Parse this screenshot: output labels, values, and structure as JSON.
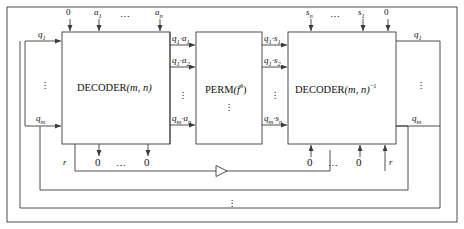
{
  "diagram": {
    "stroke_color": "#3b3b3b",
    "background": "#ffffff",
    "boxes": [
      {
        "id": "decoder",
        "label_main": "DECODER",
        "label_args": "(m, n)",
        "label_sup": ""
      },
      {
        "id": "perm",
        "label_main": "PERM",
        "label_args": "(f",
        "label_sup": "δ"
      },
      {
        "id": "decoder_inv",
        "label_main": "DECODER",
        "label_args": "(m, n)",
        "label_sup": "−1"
      }
    ],
    "top_inputs_left": [
      {
        "label": "0",
        "italic": false
      },
      {
        "label": "a",
        "sub": "1",
        "italic": true
      },
      {
        "label": "⋯",
        "italic": false
      },
      {
        "label": "a",
        "sub": "n",
        "italic": true
      }
    ],
    "top_inputs_right": [
      {
        "label": "s",
        "sub": "n",
        "italic": true
      },
      {
        "label": "⋯",
        "italic": false
      },
      {
        "label": "s",
        "sub": "1",
        "italic": true
      },
      {
        "label": "0",
        "italic": false
      }
    ],
    "bottom_outputs_left": [
      {
        "label": "r",
        "italic": true
      },
      {
        "label": "0",
        "italic": false
      },
      {
        "label": "⋯",
        "italic": false
      },
      {
        "label": "0",
        "italic": false
      }
    ],
    "bottom_inputs_right": [
      {
        "label": "0",
        "italic": false
      },
      {
        "label": "⋯",
        "italic": false
      },
      {
        "label": "0",
        "italic": false
      },
      {
        "label": "r",
        "italic": true
      }
    ],
    "left_bus": [
      {
        "label": "q",
        "sub": "1"
      },
      {
        "label": "q",
        "sub": "m"
      }
    ],
    "right_bus": [
      {
        "label": "q",
        "sub": "1"
      },
      {
        "label": "q",
        "sub": "m"
      }
    ],
    "mid_signals_left": [
      {
        "a": "q",
        "asub": "1",
        "b": "a",
        "bsub": "1"
      },
      {
        "a": "q",
        "asub": "1",
        "b": "a",
        "bsub": "2"
      },
      {
        "a": "q",
        "asub": "m",
        "b": "a",
        "bsub": "n"
      }
    ],
    "mid_signals_right": [
      {
        "a": "q",
        "asub": "1",
        "b": "s",
        "bsub": "1"
      },
      {
        "a": "q",
        "asub": "1",
        "b": "s",
        "bsub": "2"
      },
      {
        "a": "q",
        "asub": "m",
        "b": "s",
        "bsub": "n"
      }
    ],
    "ellipsis_vertical": "⋮",
    "ellipsis_horizontal": "⋯",
    "feedback_marker": "triangle-right"
  }
}
